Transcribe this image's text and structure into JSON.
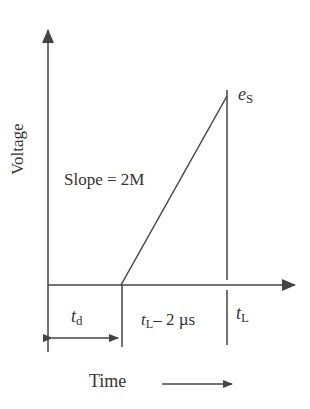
{
  "diagram": {
    "y_axis_label": "Voltage",
    "x_axis_label": "Time",
    "slope_label": "Slope = 2M",
    "peak_label": {
      "var": "e",
      "sub": "S"
    },
    "td_label": {
      "var": "t",
      "sub": "d"
    },
    "ramp_duration_label": {
      "var": "t",
      "sub": "L",
      "rest": "– 2 µs"
    },
    "tl_label": {
      "var": "t",
      "sub": "L"
    }
  },
  "colors": {
    "line": "#444444",
    "text": "#333333",
    "background": "#ffffff"
  }
}
